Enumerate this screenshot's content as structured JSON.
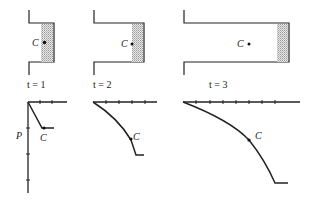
{
  "figure": {
    "panels": [
      {
        "time_label": "t = 1",
        "point_label": "C"
      },
      {
        "time_label": "t = 2",
        "point_label": "C"
      },
      {
        "time_label": "t = 3",
        "point_label": "C"
      }
    ],
    "graphs": [
      {
        "axis_label": "P",
        "point_label": "C"
      },
      {
        "point_label": "C"
      },
      {
        "point_label": "C"
      }
    ]
  }
}
